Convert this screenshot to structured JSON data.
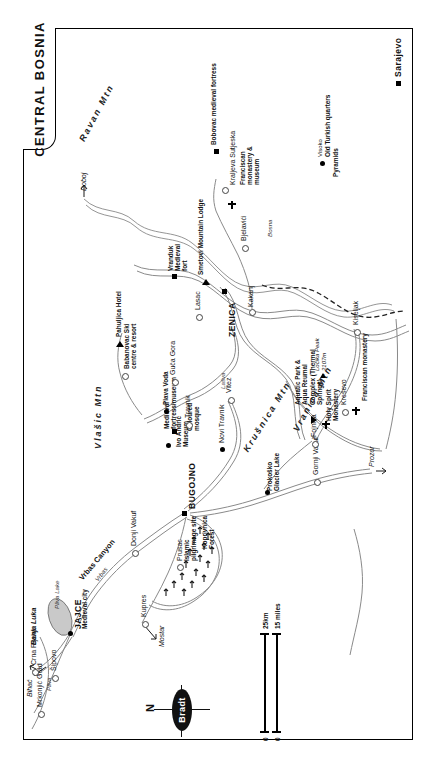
{
  "title": "CENTRAL BOSNIA",
  "publisher_logo": "Bradt",
  "compass": {
    "north_label": "N"
  },
  "scale": {
    "zero_km": "0",
    "zero_mi": "0",
    "km_label": "25km",
    "miles_label": "15 miles"
  },
  "cities_major": [
    {
      "name": "Sarajevo"
    },
    {
      "name": "ZENICA"
    },
    {
      "name": "BUGOJNO"
    },
    {
      "name": "JAJCE"
    },
    {
      "name": "Travnik"
    }
  ],
  "places": [
    {
      "name": "Sarajevo",
      "type": "capital"
    },
    {
      "name": "Visoko",
      "type": "town"
    },
    {
      "name": "Kraljeva Sutjeska",
      "type": "village"
    },
    {
      "name": "Kakanj",
      "type": "town"
    },
    {
      "name": "Kiseljak",
      "type": "town"
    },
    {
      "name": "Kreševo",
      "type": "town"
    },
    {
      "name": "Fojnica",
      "type": "town"
    },
    {
      "name": "ZENICA",
      "type": "city"
    },
    {
      "name": "Bjelavići",
      "type": "village"
    },
    {
      "name": "Lasac",
      "type": "village"
    },
    {
      "name": "Vranduk",
      "type": "village"
    },
    {
      "name": "Vitez",
      "type": "town"
    },
    {
      "name": "Guča Gora",
      "type": "village"
    },
    {
      "name": "Travnik",
      "type": "town"
    },
    {
      "name": "Novi Travnik",
      "type": "town"
    },
    {
      "name": "Donji Vakuf",
      "type": "town"
    },
    {
      "name": "BUGOJNO",
      "type": "city"
    },
    {
      "name": "Gornji Vakuf",
      "type": "town"
    },
    {
      "name": "Prozor",
      "type": "town"
    },
    {
      "name": "Kupres",
      "type": "town"
    },
    {
      "name": "JAJCE",
      "type": "city"
    },
    {
      "name": "Šipovo",
      "type": "town"
    },
    {
      "name": "Crna Rijeka",
      "type": "village"
    },
    {
      "name": "Mrkonjić Grad",
      "type": "town"
    },
    {
      "name": "Prusac",
      "type": "village"
    }
  ],
  "attractions": [
    {
      "label": "Bobovac medieval fortress"
    },
    {
      "label": "Franciscan monastery & museum"
    },
    {
      "label": "Old Turkish quarters"
    },
    {
      "label": "Pyramids"
    },
    {
      "label": "Franciscan monastery"
    },
    {
      "label": "Holy Spirit Monastery"
    },
    {
      "label": "Aquatic Park & Aqua Reumal Complex (Thermal Springs)"
    },
    {
      "label": "Prokoško Glacier Lake"
    },
    {
      "label": "Smetovi Mountain Lodge"
    },
    {
      "label": "Vranduk Medieval fort"
    },
    {
      "label": "Pahuljica Hotel"
    },
    {
      "label": "Babanovac Ski centre & resort"
    },
    {
      "label": "Plava Voda"
    },
    {
      "label": "Coloured mosque"
    },
    {
      "label": "Medieval fortress/museum"
    },
    {
      "label": "Ivo Andrić Museum"
    },
    {
      "label": "Islamic pilgrimage site"
    },
    {
      "label": "Medieval city"
    },
    {
      "label": "Koprivnica Forest"
    }
  ],
  "mountains": [
    {
      "name": "Ravan Mtn"
    },
    {
      "name": "Vlašic Mtn"
    },
    {
      "name": "Krušnica Mtn"
    },
    {
      "name": "Vranica Mtn"
    }
  ],
  "peaks": [
    {
      "name": "Ločika Peak",
      "elevation": "2107m"
    }
  ],
  "rivers": [
    {
      "name": "Bosna"
    },
    {
      "name": "Lašva"
    },
    {
      "name": "Vrbas"
    },
    {
      "name": "Pliva"
    }
  ],
  "water_features": [
    {
      "name": "Pliva Lake"
    },
    {
      "name": "Vrbas Canyon"
    },
    {
      "name": "Prokoško Glacier Lake"
    }
  ],
  "off_map_directions": [
    {
      "name": "Doboj"
    },
    {
      "name": "Banja Luka"
    },
    {
      "name": "Bihać"
    },
    {
      "name": "Mostar"
    }
  ]
}
